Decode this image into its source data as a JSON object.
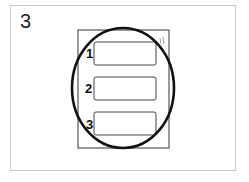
{
  "figure": {
    "panel_number": "3",
    "slots": [
      {
        "label": "1"
      },
      {
        "label": "2"
      },
      {
        "label": "3"
      }
    ],
    "corner_mark": "||",
    "colors": {
      "outline": "#111111",
      "border": "#c8c8c8",
      "device": "#555555"
    }
  }
}
